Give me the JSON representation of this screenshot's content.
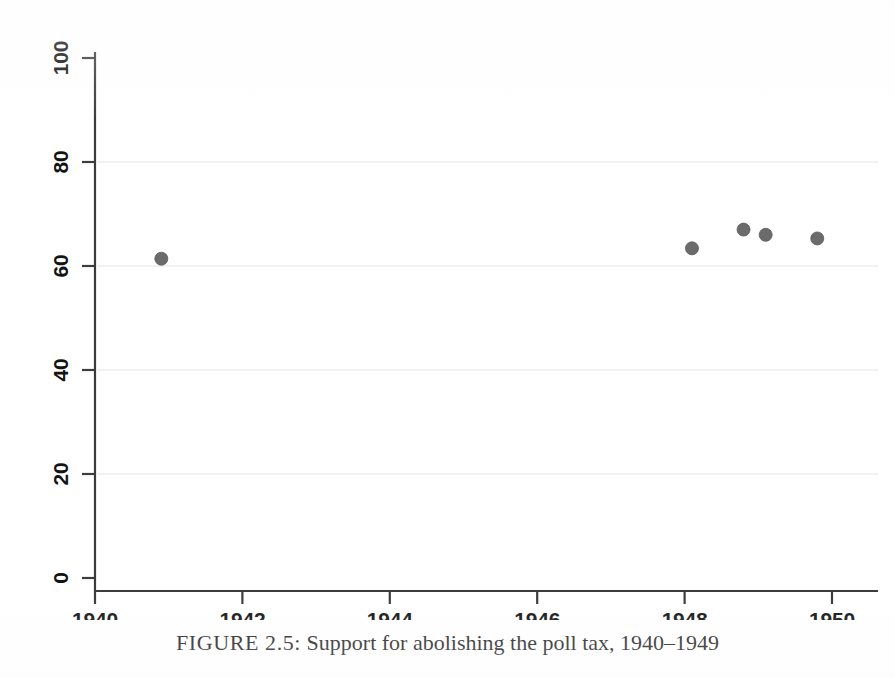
{
  "caption": {
    "figure_number": "FIGURE 2.5:",
    "text": "Support for abolishing the poll tax, 1940–1949",
    "full": "FIGURE 2.5: Support for abolishing the poll tax, 1940–1949"
  },
  "colors": {
    "marker": "#6b6b6b",
    "marker_edge": "#5a5a5a",
    "axis": "#3c3c3c",
    "gridline": "#ececec",
    "background": "#ffffff",
    "text": "#141414"
  },
  "chart_data": {
    "type": "scatter",
    "title": "",
    "subtitle": "",
    "xlabel": "",
    "ylabel": "",
    "xlim": [
      1940,
      1950
    ],
    "ylim": [
      0,
      100
    ],
    "xticks": [
      1940,
      1942,
      1944,
      1946,
      1948,
      1950
    ],
    "xtick_labels": [
      "1940",
      "1942",
      "1944",
      "1946",
      "1948",
      "1950"
    ],
    "yticks": [
      0,
      20,
      40,
      60,
      80,
      100
    ],
    "ytick_labels": [
      "0",
      "20",
      "40",
      "60",
      "80",
      "100"
    ],
    "grid": true,
    "grid_axis": "y",
    "grid_values": [
      20,
      40,
      60,
      80
    ],
    "legend": false,
    "legend_position": "none",
    "marker_shape": "circle",
    "marker_size": 13,
    "series": [
      {
        "name": "Support for abolishing the poll tax (%)",
        "points": [
          {
            "x": 1940.9,
            "y": 61.4
          },
          {
            "x": 1948.1,
            "y": 63.4
          },
          {
            "x": 1948.8,
            "y": 67.0
          },
          {
            "x": 1949.1,
            "y": 66.0
          },
          {
            "x": 1949.8,
            "y": 65.3
          }
        ]
      }
    ]
  }
}
